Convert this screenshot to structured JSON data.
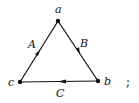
{
  "diagram": {
    "type": "directed-triangle-graph",
    "vertices": [
      {
        "id": "a",
        "label": "a",
        "x": 58,
        "y": 21
      },
      {
        "id": "b",
        "label": "b",
        "x": 98,
        "y": 81
      },
      {
        "id": "c",
        "label": "c",
        "x": 20,
        "y": 82
      }
    ],
    "edges": [
      {
        "label": "A",
        "from": "c",
        "to": "a"
      },
      {
        "label": "B",
        "from": "a",
        "to": "b"
      },
      {
        "label": "C",
        "from": "b",
        "to": "c"
      }
    ],
    "trailing_punctuation": ";"
  },
  "colors": {
    "stroke": "#111111",
    "background": "#ffffff"
  }
}
